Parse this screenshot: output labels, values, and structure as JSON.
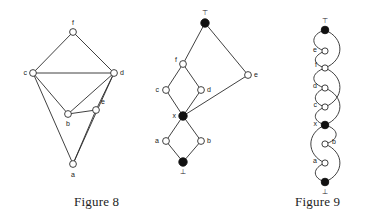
{
  "page": {
    "background_color": "#ffffff",
    "ink_color": "#2b2b2b",
    "filled_node_color": "#111111",
    "open_node_color": "#ffffff"
  },
  "captions": {
    "figure_8": "Figure 8",
    "figure_9": "Figure 9"
  },
  "figure_8": {
    "caption": "Figure 8",
    "description": "Undirected graph with six labelled open circular vertices",
    "nodes": [
      {
        "id": "f",
        "label": "f",
        "x": 73,
        "y": 32,
        "style": "open",
        "label_pos": "above"
      },
      {
        "id": "c",
        "label": "c",
        "x": 33,
        "y": 73,
        "style": "open",
        "label_pos": "left"
      },
      {
        "id": "d",
        "label": "d",
        "x": 114,
        "y": 73,
        "style": "open",
        "label_pos": "right"
      },
      {
        "id": "b",
        "label": "b",
        "x": 68,
        "y": 114,
        "style": "open",
        "label_pos": "below"
      },
      {
        "id": "e",
        "label": "e",
        "x": 96,
        "y": 110,
        "style": "open",
        "label_pos": "above-right"
      },
      {
        "id": "a",
        "label": "a",
        "x": 73,
        "y": 164,
        "style": "open",
        "label_pos": "below"
      }
    ],
    "edges": [
      {
        "from": "f",
        "to": "c"
      },
      {
        "from": "f",
        "to": "d"
      },
      {
        "from": "c",
        "to": "d"
      },
      {
        "from": "c",
        "to": "b"
      },
      {
        "from": "c",
        "to": "a"
      },
      {
        "from": "d",
        "to": "b"
      },
      {
        "from": "d",
        "to": "e"
      },
      {
        "from": "d",
        "to": "a"
      },
      {
        "from": "b",
        "to": "e"
      },
      {
        "from": "e",
        "to": "a"
      }
    ]
  },
  "figure_8_lattice": {
    "description": "Hasse-style lattice diagram with top and bottom elements filled",
    "nodes": [
      {
        "id": "top",
        "label": "⊤",
        "x": 205,
        "y": 23,
        "style": "filled",
        "label_pos": "above"
      },
      {
        "id": "e",
        "label": "e",
        "x": 248,
        "y": 75,
        "style": "open",
        "label_pos": "right"
      },
      {
        "id": "f",
        "label": "f",
        "x": 183,
        "y": 64,
        "style": "open",
        "label_pos": "left"
      },
      {
        "id": "c",
        "label": "c",
        "x": 166,
        "y": 90,
        "style": "open",
        "label_pos": "left"
      },
      {
        "id": "d",
        "label": "d",
        "x": 201,
        "y": 90,
        "style": "open",
        "label_pos": "right"
      },
      {
        "id": "x",
        "label": "x",
        "x": 183,
        "y": 116,
        "style": "filled",
        "label_pos": "left"
      },
      {
        "id": "a",
        "label": "a",
        "x": 166,
        "y": 141,
        "style": "open",
        "label_pos": "left"
      },
      {
        "id": "b",
        "label": "b",
        "x": 201,
        "y": 141,
        "style": "open",
        "label_pos": "right"
      },
      {
        "id": "bottom",
        "label": "⊥",
        "x": 183,
        "y": 162,
        "style": "filled",
        "label_pos": "below"
      }
    ],
    "edges": [
      {
        "from": "top",
        "to": "f"
      },
      {
        "from": "top",
        "to": "e"
      },
      {
        "from": "e",
        "to": "x"
      },
      {
        "from": "f",
        "to": "c"
      },
      {
        "from": "f",
        "to": "d"
      },
      {
        "from": "c",
        "to": "x"
      },
      {
        "from": "d",
        "to": "x"
      },
      {
        "from": "x",
        "to": "a"
      },
      {
        "from": "x",
        "to": "b"
      },
      {
        "from": "a",
        "to": "bottom"
      },
      {
        "from": "b",
        "to": "bottom"
      }
    ]
  },
  "figure_9": {
    "caption": "Figure 9",
    "description": "Vertical chain lattice with curved edges linking successive elements",
    "nodes": [
      {
        "id": "top",
        "label": "⊤",
        "x": 325,
        "y": 30,
        "style": "filled",
        "label_pos": "above"
      },
      {
        "id": "e",
        "label": "e",
        "x": 325,
        "y": 51,
        "style": "open",
        "label_pos": "left"
      },
      {
        "id": "f",
        "label": "f",
        "x": 325,
        "y": 68,
        "style": "open",
        "label_pos": "left"
      },
      {
        "id": "d",
        "label": "d",
        "x": 325,
        "y": 88,
        "style": "open",
        "label_pos": "left"
      },
      {
        "id": "c",
        "label": "c",
        "x": 325,
        "y": 107,
        "style": "open",
        "label_pos": "left"
      },
      {
        "id": "x",
        "label": "x",
        "x": 325,
        "y": 125,
        "style": "filled",
        "label_pos": "left"
      },
      {
        "id": "b",
        "label": "b",
        "x": 325,
        "y": 144,
        "style": "open",
        "label_pos": "right"
      },
      {
        "id": "a",
        "label": "a",
        "x": 325,
        "y": 163,
        "style": "open",
        "label_pos": "left"
      },
      {
        "id": "bottom",
        "label": "⊥",
        "x": 325,
        "y": 182,
        "style": "filled",
        "label_pos": "below"
      }
    ],
    "edges": [
      {
        "from": "top",
        "to": "e",
        "bow": "left"
      },
      {
        "from": "top",
        "to": "f",
        "bow": "right"
      },
      {
        "from": "e",
        "to": "f",
        "bow": "left"
      },
      {
        "from": "f",
        "to": "d",
        "bow": "left"
      },
      {
        "from": "f",
        "to": "c",
        "bow": "right"
      },
      {
        "from": "d",
        "to": "c",
        "bow": "left"
      },
      {
        "from": "c",
        "to": "x",
        "bow": "left"
      },
      {
        "from": "d",
        "to": "x",
        "bow": "right"
      },
      {
        "from": "x",
        "to": "b",
        "bow": "right"
      },
      {
        "from": "x",
        "to": "a",
        "bow": "left"
      },
      {
        "from": "b",
        "to": "bottom",
        "bow": "right"
      },
      {
        "from": "a",
        "to": "bottom",
        "bow": "left"
      }
    ]
  }
}
